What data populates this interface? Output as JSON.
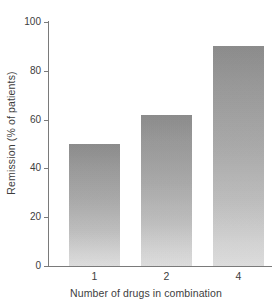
{
  "chart_data": {
    "type": "bar",
    "title": "",
    "subtitle": "",
    "categories": [
      "1",
      "2",
      "4"
    ],
    "values": [
      50,
      62,
      90
    ],
    "series": [
      {
        "name": "Remission",
        "values": [
          50,
          62,
          90
        ]
      }
    ],
    "xlabel": "Number of drugs in combination",
    "ylabel": "Remission (% of patients)",
    "ylim": [
      0,
      100
    ],
    "yticks": [
      0,
      20,
      40,
      60,
      80,
      100
    ],
    "ytick_labels": [
      "0",
      "20",
      "40",
      "60",
      "80",
      "100"
    ],
    "xtick_labels": [
      "1",
      "2",
      "4"
    ],
    "grid": false,
    "legend": false,
    "legend_position": "none",
    "annotations": [],
    "colors": {
      "background": "#ffffff",
      "axis": "#7a7a7a",
      "text": "#3d3d3d",
      "bar_top": "#8c8c8c",
      "bar_bottom": "#e2e2e2"
    }
  }
}
